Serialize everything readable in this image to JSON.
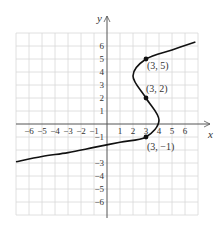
{
  "chart_data": {
    "type": "line",
    "title": "",
    "xlabel": "x",
    "ylabel": "y",
    "xlim": [
      -7,
      7
    ],
    "ylim": [
      -7,
      7
    ],
    "grid": true,
    "x_ticks": [
      "-6",
      "-5",
      "-4",
      "-3",
      "-2",
      "-1",
      "1",
      "2",
      "3",
      "4",
      "5",
      "6"
    ],
    "y_ticks": [
      "6",
      "5",
      "4",
      "3",
      "2",
      "1",
      "-1",
      "-3",
      "-4",
      "-5",
      "-6"
    ],
    "series": [
      {
        "name": "curve",
        "description": "cubic in y: x = f(y), passing through (3,-1), (3,2), (3,5)",
        "x": [
          -7.0,
          -5.0,
          -3.0,
          -1.0,
          1.0,
          3.0,
          4.0,
          3.0,
          2.0,
          3.0,
          5.0,
          6.8
        ],
        "y": [
          -2.9,
          -2.5,
          -2.2,
          -1.8,
          -1.4,
          -1.0,
          0.3,
          2.0,
          3.7,
          5.0,
          5.7,
          6.3
        ]
      }
    ],
    "points": [
      {
        "x": 3,
        "y": 5,
        "label": "(3, 5)"
      },
      {
        "x": 3,
        "y": 2,
        "label": "(3, 2)"
      },
      {
        "x": 3,
        "y": -1,
        "label": "(3, −1)"
      }
    ]
  },
  "labels": {
    "x_axis": "x",
    "y_axis": "y",
    "p1": "(3, 5)",
    "p2": "(3, 2)",
    "p3": "(3, −1)",
    "xt": {
      "m6": "−6",
      "m5": "−5",
      "m4": "−4",
      "m3": "−3",
      "m2": "−2",
      "m1": "−1",
      "p1": "1",
      "p2": "2",
      "p3": "3",
      "p4": "4",
      "p5": "5",
      "p6": "6"
    },
    "yt": {
      "p6": "6",
      "p5": "5",
      "p4": "4",
      "p3": "3",
      "p2": "2",
      "p1": "1",
      "m1": "−1",
      "m3": "−3",
      "m4": "−4",
      "m5": "−5",
      "m6": "−6"
    }
  },
  "colors": {
    "grid": "#d8d8d8",
    "axis": "#555555",
    "curve": "#111111"
  }
}
